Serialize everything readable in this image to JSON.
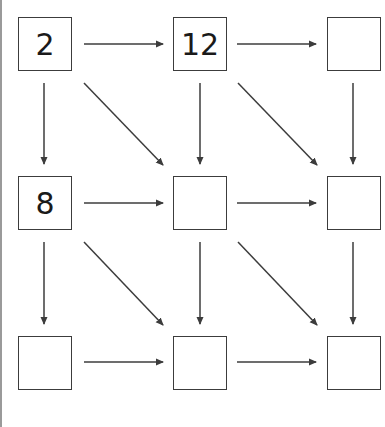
{
  "diagram": {
    "type": "number-grid-with-arrows",
    "colors": {
      "stroke": "#3c3c3c",
      "text": "#1a1a1a",
      "background": "#ffffff",
      "left_rule": "#9a9a9a"
    },
    "grid": {
      "rows": 3,
      "cols": 3,
      "cells": [
        {
          "id": "r0c0",
          "row": 0,
          "col": 0,
          "value": "2"
        },
        {
          "id": "r0c1",
          "row": 0,
          "col": 1,
          "value": "12"
        },
        {
          "id": "r0c2",
          "row": 0,
          "col": 2,
          "value": ""
        },
        {
          "id": "r1c0",
          "row": 1,
          "col": 0,
          "value": "8"
        },
        {
          "id": "r1c1",
          "row": 1,
          "col": 1,
          "value": ""
        },
        {
          "id": "r1c2",
          "row": 1,
          "col": 2,
          "value": ""
        },
        {
          "id": "r2c0",
          "row": 2,
          "col": 0,
          "value": ""
        },
        {
          "id": "r2c1",
          "row": 2,
          "col": 1,
          "value": ""
        },
        {
          "id": "r2c2",
          "row": 2,
          "col": 2,
          "value": ""
        }
      ]
    },
    "edges": [
      {
        "from": "r0c0",
        "to": "r0c1",
        "dir": "right"
      },
      {
        "from": "r0c1",
        "to": "r0c2",
        "dir": "right"
      },
      {
        "from": "r1c0",
        "to": "r1c1",
        "dir": "right"
      },
      {
        "from": "r1c1",
        "to": "r1c2",
        "dir": "right"
      },
      {
        "from": "r2c0",
        "to": "r2c1",
        "dir": "right"
      },
      {
        "from": "r2c1",
        "to": "r2c2",
        "dir": "right"
      },
      {
        "from": "r0c0",
        "to": "r1c0",
        "dir": "down"
      },
      {
        "from": "r0c1",
        "to": "r1c1",
        "dir": "down"
      },
      {
        "from": "r0c2",
        "to": "r1c2",
        "dir": "down"
      },
      {
        "from": "r1c0",
        "to": "r2c0",
        "dir": "down"
      },
      {
        "from": "r1c1",
        "to": "r2c1",
        "dir": "down"
      },
      {
        "from": "r1c2",
        "to": "r2c2",
        "dir": "down"
      },
      {
        "from": "r0c0",
        "to": "r1c1",
        "dir": "diagonal"
      },
      {
        "from": "r0c1",
        "to": "r1c2",
        "dir": "diagonal"
      },
      {
        "from": "r1c0",
        "to": "r2c1",
        "dir": "diagonal"
      },
      {
        "from": "r1c1",
        "to": "r2c2",
        "dir": "diagonal"
      }
    ]
  }
}
